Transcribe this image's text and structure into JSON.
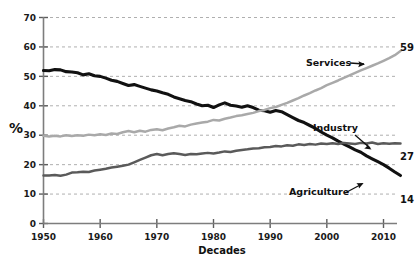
{
  "chart_data": {
    "type": "line",
    "title": "",
    "subtitle": "",
    "xlabel": "Decades",
    "ylabel": "%",
    "xlim": [
      1950,
      2014
    ],
    "ylim": [
      0,
      70
    ],
    "grid": true,
    "legend_position": "inline-annotations",
    "x_ticks": [
      "1950",
      "1960",
      "1970",
      "1980",
      "1990",
      "2000",
      "2010"
    ],
    "x_tick_values": [
      1950,
      1960,
      1970,
      1980,
      1990,
      2000,
      2010
    ],
    "y_ticks": [
      "0",
      "10",
      "20",
      "30",
      "40",
      "50",
      "60",
      "70"
    ],
    "y_tick_values": [
      0,
      10,
      20,
      30,
      40,
      50,
      60,
      70
    ],
    "annotations": [
      {
        "name": "services-annotation",
        "text": "Services",
        "points_to": "services"
      },
      {
        "name": "industry-annotation",
        "text": "Industry",
        "points_to": "industry"
      },
      {
        "name": "agriculture-annotation",
        "text": "Agriculture",
        "points_to": "agriculture"
      }
    ],
    "end_labels": [
      {
        "name": "services-end-value",
        "series": "Services",
        "value": "59"
      },
      {
        "name": "industry-end-value",
        "series": "Industry",
        "value": "27"
      },
      {
        "name": "agriculture-end-value",
        "series": "Agriculture",
        "value": "14"
      }
    ],
    "x": [
      1950,
      1951,
      1952,
      1953,
      1954,
      1955,
      1956,
      1957,
      1958,
      1959,
      1960,
      1961,
      1962,
      1963,
      1964,
      1965,
      1966,
      1967,
      1968,
      1969,
      1970,
      1971,
      1972,
      1973,
      1974,
      1975,
      1976,
      1977,
      1978,
      1979,
      1980,
      1981,
      1982,
      1983,
      1984,
      1985,
      1986,
      1987,
      1988,
      1989,
      1990,
      1991,
      1992,
      1993,
      1994,
      1995,
      1996,
      1997,
      1998,
      1999,
      2000,
      2001,
      2002,
      2003,
      2004,
      2005,
      2006,
      2007,
      2008,
      2009,
      2010,
      2011,
      2012,
      2013
    ],
    "series": [
      {
        "name": "Agriculture",
        "color": "#111111",
        "end_value": 14,
        "values": [
          52.0,
          51.9,
          52.3,
          52.2,
          51.6,
          51.5,
          51.2,
          50.5,
          50.9,
          50.2,
          50.0,
          49.4,
          48.7,
          48.3,
          47.6,
          46.9,
          47.2,
          46.6,
          46.0,
          45.4,
          45.0,
          44.4,
          43.9,
          43.0,
          42.4,
          41.8,
          41.4,
          40.6,
          40.0,
          40.2,
          39.4,
          40.3,
          41.0,
          40.2,
          39.9,
          39.5,
          40.0,
          39.4,
          38.5,
          38.3,
          37.8,
          38.4,
          38.0,
          37.0,
          36.0,
          35.0,
          34.3,
          33.3,
          32.3,
          31.1,
          30.0,
          29.1,
          28.0,
          27.0,
          26.0,
          25.0,
          24.2,
          23.0,
          22.0,
          21.0,
          20.0,
          18.8,
          17.5,
          16.3
        ],
        "style": "thick-black"
      },
      {
        "name": "Industry",
        "color": "#5a5a5a",
        "end_value": 27,
        "values": [
          16.3,
          16.3,
          16.5,
          16.2,
          16.6,
          17.3,
          17.4,
          17.6,
          17.5,
          18.0,
          18.3,
          18.6,
          19.0,
          19.3,
          19.6,
          20.0,
          20.8,
          21.6,
          22.4,
          23.2,
          23.6,
          23.2,
          23.6,
          23.9,
          23.6,
          23.3,
          23.6,
          23.5,
          23.8,
          24.0,
          23.8,
          24.1,
          24.5,
          24.3,
          24.7,
          25.0,
          25.2,
          25.5,
          25.6,
          25.9,
          26.0,
          26.3,
          26.2,
          26.6,
          26.4,
          26.9,
          26.7,
          27.0,
          26.8,
          27.2,
          27.0,
          27.3,
          27.0,
          27.4,
          27.2,
          27.0,
          27.4,
          27.2,
          27.5,
          27.0,
          27.3,
          27.1,
          27.3,
          27.2
        ],
        "style": "medium-gray"
      },
      {
        "name": "Services",
        "color": "#a9a9a9",
        "end_value": 59,
        "values": [
          29.8,
          29.6,
          29.8,
          29.6,
          30.0,
          29.7,
          30.0,
          29.8,
          30.2,
          30.0,
          30.3,
          30.1,
          30.6,
          30.4,
          31.0,
          31.4,
          31.0,
          31.5,
          31.2,
          31.8,
          32.0,
          31.7,
          32.3,
          32.7,
          33.2,
          33.0,
          33.6,
          34.0,
          34.3,
          34.6,
          35.2,
          35.0,
          35.6,
          36.0,
          36.5,
          36.8,
          37.2,
          37.6,
          38.2,
          38.6,
          39.2,
          39.6,
          40.3,
          41.0,
          41.8,
          42.6,
          43.5,
          44.3,
          45.2,
          46.0,
          47.0,
          47.8,
          48.6,
          49.5,
          50.3,
          51.2,
          52.0,
          52.8,
          53.6,
          54.4,
          55.3,
          56.2,
          57.2,
          58.6
        ],
        "style": "light-gray"
      }
    ]
  }
}
